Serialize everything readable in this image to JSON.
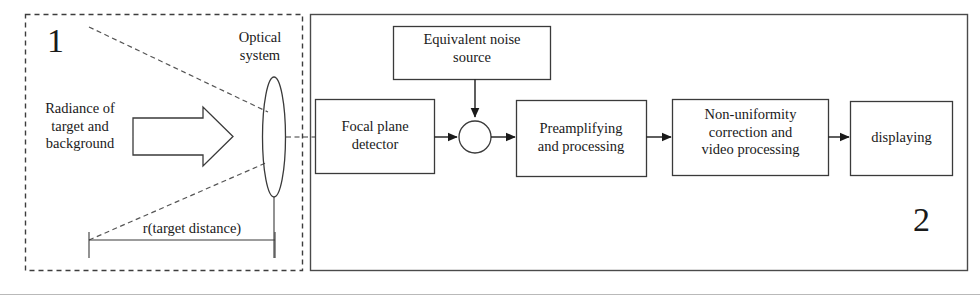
{
  "figure": {
    "type": "block-diagram",
    "panels": [
      {
        "id": "panel-1",
        "number": "1",
        "style": "dashed",
        "description": "Scene / optics section"
      },
      {
        "id": "panel-2",
        "number": "2",
        "style": "solid",
        "description": "Electronics / signal chain section"
      }
    ]
  },
  "scene": {
    "source_label": "Radiance of\ntarget and\nbackground",
    "optics_label": "Optical\nsystem",
    "distance_label": "r(target distance)",
    "arrow_icon": "block-arrow-right",
    "lens_icon": "lens-ellipse"
  },
  "chain": {
    "blocks": [
      {
        "id": "focal-plane-detector",
        "label": "Focal plane\ndetector"
      },
      {
        "id": "equivalent-noise-source",
        "label": "Equivalent noise\nsource"
      },
      {
        "id": "preamplifying-and-processing",
        "label": "Preamplifying\nand processing"
      },
      {
        "id": "non-uniformity-correction",
        "label": "Non-uniformity\ncorrection and\nvideo processing"
      },
      {
        "id": "displaying",
        "label": "displaying"
      }
    ],
    "summing_junction": {
      "id": "summing-junction",
      "shape": "circle",
      "label": ""
    }
  },
  "colors": {
    "ink": "#1a1a1a",
    "line": "#3a3a3a",
    "panel_border": "#4a4a4a",
    "background": "#ffffff",
    "rule": "#b9b9b9"
  }
}
